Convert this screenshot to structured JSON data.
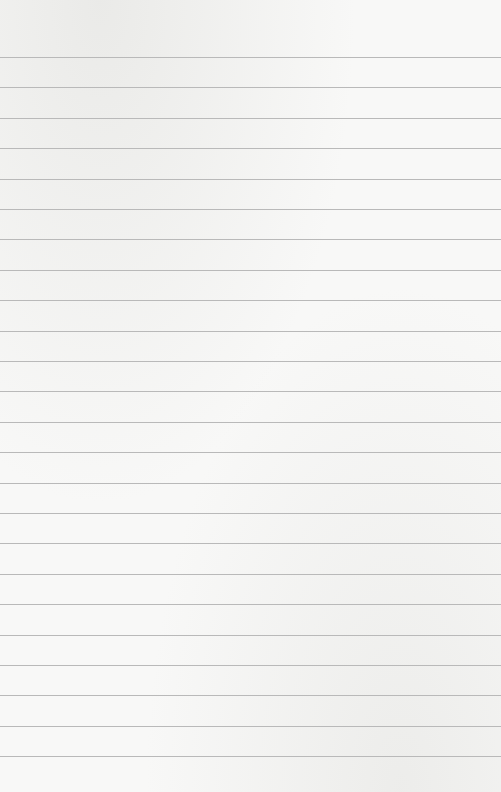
{
  "paper": {
    "type": "lined-paper",
    "background_color": "#f8f8f7",
    "line_color": "#b9b9b9",
    "line_count": 24,
    "first_line_y": 57,
    "line_spacing": 30.4
  }
}
